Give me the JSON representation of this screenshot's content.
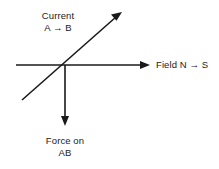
{
  "diagram": {
    "background_color": "#ffffff",
    "stroke_color": "#1a1a1a",
    "text_color": "#1a1a1a",
    "labels": {
      "current": {
        "line1": "Current",
        "line2": "A → B"
      },
      "field": {
        "line1": "Field N → S"
      },
      "force": {
        "line1": "Force on",
        "line2": "AB"
      }
    },
    "arrows": [
      {
        "name": "field-arrow",
        "direction": "right",
        "from": [
          16,
          65
        ],
        "to": [
          150,
          65
        ]
      },
      {
        "name": "current-arrow",
        "direction": "up-right",
        "from": [
          22,
          100
        ],
        "to": [
          122,
          12
        ]
      },
      {
        "name": "force-arrow",
        "direction": "down",
        "from": [
          65,
          65
        ],
        "to": [
          65,
          126
        ]
      }
    ],
    "origin": [
      65,
      65
    ]
  }
}
